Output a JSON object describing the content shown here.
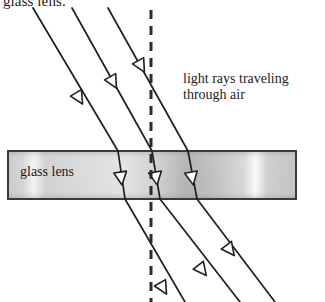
{
  "diagram": {
    "type": "optics-ray-diagram",
    "canvas": {
      "width": 325,
      "height": 302,
      "background": "#ffffff"
    },
    "labels": {
      "top_clipped": "glass lens.",
      "lens": "glass lens",
      "air_line1": "light rays traveling",
      "air_line2": "through air"
    },
    "colors": {
      "ray": "#1f1f1f",
      "arrow_fill": "#ffffff",
      "arrow_stroke": "#1f1f1f",
      "lens_border": "#3a3a3a",
      "lens_fill_light": "#dcdcdc",
      "lens_fill_mid": "#c2c2c2",
      "lens_fill_dark": "#ababab",
      "normal_line": "#2b2b2b",
      "text": "#1b1b1b"
    },
    "lens": {
      "name": "glass lens",
      "x": 8,
      "y": 151,
      "width": 288,
      "height": 48,
      "border_width": 2
    },
    "normal": {
      "name": "normal-dashed-line",
      "x": 151,
      "y1": 10,
      "y2": 302,
      "dash": "9 7",
      "width": 3
    },
    "rays": [
      {
        "id": "ray-1",
        "incident": {
          "x1": 33,
          "y1": 8,
          "x2": 118,
          "y2": 151
        },
        "refracted": {
          "x1": 118,
          "y1": 151,
          "x2": 125,
          "y2": 199
        },
        "exit": {
          "x1": 125,
          "y1": 199,
          "x2": 185,
          "y2": 302
        },
        "arrows": [
          {
            "x": 79,
            "y": 98,
            "seg": "incident"
          },
          {
            "x": 121,
            "y": 178,
            "seg": "refracted"
          },
          {
            "x": 163,
            "y": 288,
            "seg": "exit"
          }
        ]
      },
      {
        "id": "ray-2",
        "incident": {
          "x1": 72,
          "y1": 8,
          "x2": 152,
          "y2": 151
        },
        "refracted": {
          "x1": 152,
          "y1": 151,
          "x2": 160,
          "y2": 199
        },
        "exit": {
          "x1": 160,
          "y1": 199,
          "x2": 240,
          "y2": 302
        },
        "arrows": [
          {
            "x": 113,
            "y": 82,
            "seg": "incident"
          },
          {
            "x": 156,
            "y": 178,
            "seg": "refracted"
          },
          {
            "x": 202,
            "y": 270,
            "seg": "exit"
          }
        ]
      },
      {
        "id": "ray-3",
        "incident": {
          "x1": 108,
          "y1": 8,
          "x2": 188,
          "y2": 151
        },
        "refracted": {
          "x1": 188,
          "y1": 151,
          "x2": 197,
          "y2": 199
        },
        "exit": {
          "x1": 197,
          "y1": 199,
          "x2": 275,
          "y2": 302
        },
        "arrows": [
          {
            "x": 141,
            "y": 66,
            "seg": "incident"
          },
          {
            "x": 192,
            "y": 178,
            "seg": "refracted"
          },
          {
            "x": 230,
            "y": 250,
            "seg": "exit"
          }
        ]
      }
    ]
  }
}
